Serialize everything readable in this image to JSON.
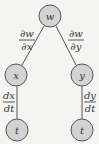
{
  "diagram": {
    "title": "",
    "colors": {
      "node_fill": "#d3d3d3",
      "node_stroke": "#555555",
      "edge": "#555555",
      "background": "#f4f4f2",
      "text": "#333333"
    },
    "nodes": [
      {
        "id": "w",
        "label": "w",
        "cx": 50,
        "cy": 16
      },
      {
        "id": "x",
        "label": "x",
        "cx": 16,
        "cy": 75
      },
      {
        "id": "y",
        "label": "y",
        "cx": 82,
        "cy": 75
      },
      {
        "id": "t1",
        "label": "t",
        "cx": 17,
        "cy": 130
      },
      {
        "id": "t2",
        "label": "t",
        "cx": 82,
        "cy": 130
      }
    ],
    "edges": [
      {
        "from": "w",
        "to": "x",
        "num": "∂w",
        "den": "∂x"
      },
      {
        "from": "w",
        "to": "y",
        "num": "∂w",
        "den": "∂y"
      },
      {
        "from": "x",
        "to": "t1",
        "num": "dx",
        "den": "dt"
      },
      {
        "from": "y",
        "to": "t2",
        "num": "dy",
        "den": "dt"
      }
    ]
  }
}
